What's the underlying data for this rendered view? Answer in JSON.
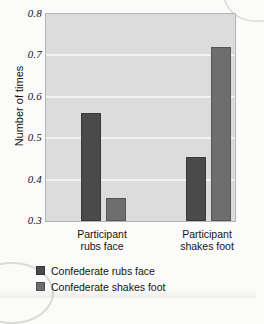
{
  "chart_data": {
    "type": "bar",
    "title": "",
    "xlabel": "",
    "ylabel": "Number of times",
    "ylim": [
      0.3,
      0.8
    ],
    "yticks": [
      "0.8",
      "0.7",
      "0.6",
      "0.5",
      "0.4",
      "0.3"
    ],
    "ytick_values": [
      0.8,
      0.7,
      0.6,
      0.5,
      0.4,
      0.3
    ],
    "grid": true,
    "legend_position": "below",
    "categories": [
      "Participant rubs face",
      "Participant shakes foot"
    ],
    "category_lines": [
      [
        "Participant",
        "rubs face"
      ],
      [
        "Participant",
        "shakes foot"
      ]
    ],
    "series": [
      {
        "name": "Confederate rubs face",
        "color": "#4a4a4a",
        "values": [
          0.56,
          0.455
        ]
      },
      {
        "name": "Confederate shakes foot",
        "color": "#6e6e6e",
        "values": [
          0.355,
          0.72
        ]
      }
    ]
  },
  "style": {
    "plot_background": "#dcdcdc",
    "gridline_color": "#f2f2f2",
    "page_background": "#fbfbf9",
    "text_color": "#141414"
  }
}
